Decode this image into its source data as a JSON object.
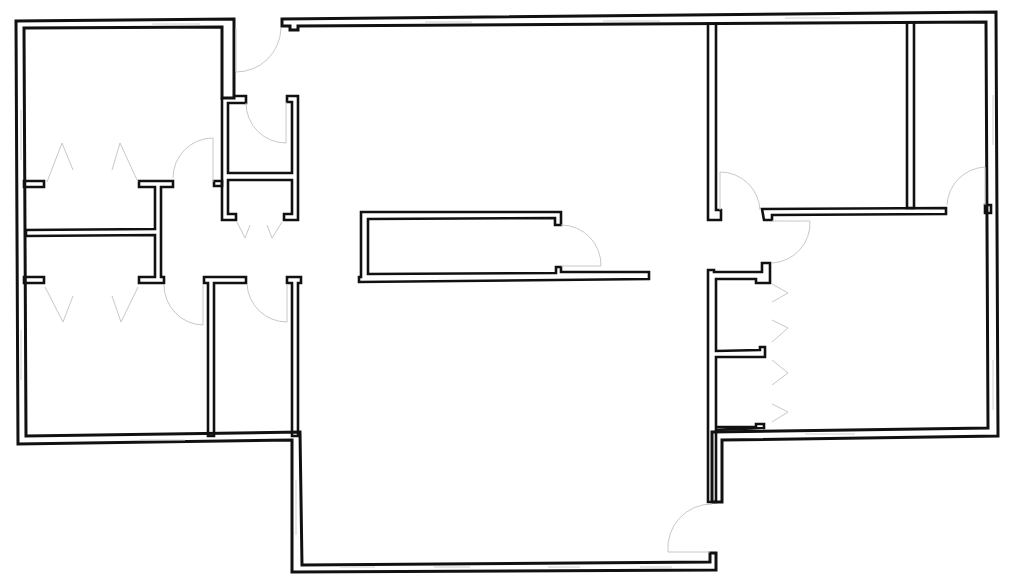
{
  "drawing": {
    "type": "architectural floor plan",
    "width": 1010,
    "height": 585,
    "colors": {
      "background": "#ffffff",
      "wall": "#111111",
      "door_swing": "#c8c8c8",
      "window": "#d0d0d0"
    },
    "rooms": [
      {
        "id": "room-top-left",
        "label": "",
        "bounds": [
          24,
          28,
          222,
          186
        ]
      },
      {
        "id": "closet-left-upper",
        "label": "",
        "bounds": [
          24,
          186,
          158,
          232
        ]
      },
      {
        "id": "closet-left-lower",
        "label": "",
        "bounds": [
          24,
          236,
          158,
          282
        ]
      },
      {
        "id": "room-bottom-left",
        "label": "",
        "bounds": [
          24,
          282,
          208,
          437
        ]
      },
      {
        "id": "bath-upper-center-left",
        "label": "",
        "bounds": [
          226,
          98,
          298,
          176
        ]
      },
      {
        "id": "closet-center-left",
        "label": "",
        "bounds": [
          226,
          176,
          298,
          220
        ]
      },
      {
        "id": "room-bottom-center-left",
        "label": "",
        "bounds": [
          212,
          280,
          296,
          437
        ]
      },
      {
        "id": "main-hall",
        "label": "",
        "bounds": [
          298,
          24,
          712,
          565
        ]
      },
      {
        "id": "center-island-room",
        "label": "",
        "bounds": [
          360,
          212,
          560,
          278
        ]
      },
      {
        "id": "room-top-right-a",
        "label": "",
        "bounds": [
          716,
          22,
          908,
          212
        ]
      },
      {
        "id": "room-top-right-b",
        "label": "",
        "bounds": [
          912,
          22,
          988,
          212
        ]
      },
      {
        "id": "closet-right-upper",
        "label": "",
        "bounds": [
          716,
          270,
          764,
          352
        ]
      },
      {
        "id": "closet-right-lower",
        "label": "",
        "bounds": [
          716,
          352,
          764,
          430
        ]
      },
      {
        "id": "room-right-large",
        "label": "",
        "bounds": [
          764,
          212,
          992,
          430
        ]
      }
    ],
    "doors": [
      {
        "id": "door-entry-top",
        "count": 1
      },
      {
        "id": "door-bath-upper",
        "count": 1
      },
      {
        "id": "door-room-top-left",
        "count": 1
      },
      {
        "id": "door-closets-left",
        "count": 4
      },
      {
        "id": "door-closets-center",
        "count": 2
      },
      {
        "id": "door-room-bottom-left",
        "count": 1
      },
      {
        "id": "door-room-bottom-center",
        "count": 1
      },
      {
        "id": "door-center-island",
        "count": 1
      },
      {
        "id": "door-top-right-a",
        "count": 1
      },
      {
        "id": "door-right-large",
        "count": 1
      },
      {
        "id": "door-top-right-b",
        "count": 1
      },
      {
        "id": "door-closets-right",
        "count": 4
      },
      {
        "id": "door-bottom-exit",
        "count": 1
      }
    ]
  }
}
